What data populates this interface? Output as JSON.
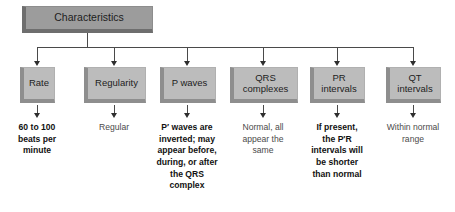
{
  "diagram": {
    "type": "flowchart",
    "orientation": "top-down",
    "root": {
      "label": "Characteristics"
    },
    "branches": [
      {
        "id": "rate",
        "box_label": "Rate",
        "caption": "60 to 100\nbeats per\nminute",
        "caption_emphasis": "bold"
      },
      {
        "id": "regularity",
        "box_label": "Regularity",
        "caption": "Regular",
        "caption_emphasis": "plain"
      },
      {
        "id": "p-waves",
        "box_label": "P waves",
        "caption": "P′ waves are\ninverted; may\nappear before,\nduring, or after\nthe QRS\ncomplex",
        "caption_emphasis": "bold"
      },
      {
        "id": "qrs-complexes",
        "box_label": "QRS\ncomplexes",
        "caption": "Normal, all\nappear the\nsame",
        "caption_emphasis": "plain"
      },
      {
        "id": "pr-intervals",
        "box_label": "PR\nintervals",
        "caption": "If present,\nthe P′R\nintervals will\nbe shorter\nthan normal",
        "caption_emphasis": "bold"
      },
      {
        "id": "qt-intervals",
        "box_label": "QT\nintervals",
        "caption": "Within normal\nrange",
        "caption_emphasis": "plain"
      }
    ],
    "colors": {
      "background": "#ffffff",
      "root_fill": "#9c9c9c",
      "root_bevel": "#6e6e6e",
      "child_fill": "#bcbcbc",
      "child_bevel": "#8e8e8e",
      "connector": "#4a4a4a",
      "arrow": "#2e2e2e",
      "text_bold": "#111111",
      "text_plain": "#4b4b4b"
    }
  }
}
